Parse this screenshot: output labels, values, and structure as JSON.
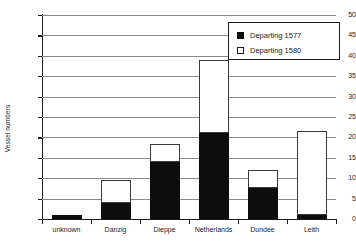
{
  "chart_data": {
    "type": "bar",
    "stacked": true,
    "title": "",
    "xlabel": "",
    "ylabel": "Vessel numbers",
    "ylim": [
      0,
      50
    ],
    "ytick_step": 5,
    "yticks": [
      0,
      5,
      10,
      15,
      20,
      25,
      30,
      35,
      40,
      45,
      50
    ],
    "grid": true,
    "categories": [
      "unknown",
      "Danzig",
      "Dieppe",
      "Netherlands",
      "Dundee",
      "Leith"
    ],
    "series": [
      {
        "name": "Departing 1577",
        "color": "#0d0d0d",
        "values": [
          1,
          4,
          14,
          21,
          7.5,
          1
        ]
      },
      {
        "name": "Departing 1580",
        "color": "#ffffff",
        "values": [
          0,
          5.5,
          4.5,
          18,
          4.5,
          20.5
        ]
      }
    ],
    "totals": [
      1,
      9.5,
      18.5,
      39,
      12,
      21.5
    ],
    "legend_position": "top-right"
  },
  "legend": {
    "entries": [
      {
        "label": "Departing 1577",
        "swatch": "filled"
      },
      {
        "label": "Departing 1580",
        "swatch": "hollow"
      }
    ]
  },
  "axes": {
    "y_title": "Vessel numbers"
  }
}
